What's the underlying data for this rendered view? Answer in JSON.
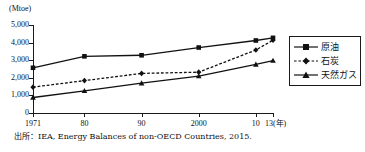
{
  "chart_data": {
    "type": "line",
    "title": "",
    "subtitle": "",
    "xlabel": "(年)",
    "ylabel": "(Mtoe)",
    "y_unit_caption": "(Mtoe)",
    "x_axis_suffix": "(年)",
    "categories": [
      "1971",
      "80",
      "90",
      "2000",
      "10",
      "13"
    ],
    "x": [
      1971,
      1980,
      1990,
      2000,
      2010,
      2013
    ],
    "xlim": [
      1971,
      2013
    ],
    "ylim": [
      0,
      5000
    ],
    "yticks": [
      0,
      1000,
      2000,
      3000,
      4000,
      5000
    ],
    "ytick_labels": [
      "0",
      "1,000",
      "2,000",
      "3,000",
      "4,000",
      "5,000"
    ],
    "xtick_labels": [
      "1971",
      "80",
      "90",
      "2000",
      "10",
      "13"
    ],
    "grid": false,
    "legend_position": "right",
    "series": [
      {
        "name": "原油",
        "values": [
          2570,
          3220,
          3280,
          3720,
          4120,
          4270
        ],
        "line_style": "solid",
        "marker": "square",
        "color": "#111111"
      },
      {
        "name": "石炭",
        "values": [
          1470,
          1840,
          2250,
          2320,
          3580,
          4140
        ],
        "line_style": "dashed",
        "marker": "diamond",
        "color": "#111111"
      },
      {
        "name": "天然ガス",
        "values": [
          880,
          1260,
          1700,
          2100,
          2760,
          2980
        ],
        "line_style": "solid",
        "marker": "triangle",
        "color": "#111111"
      }
    ]
  },
  "legend": {
    "items": [
      {
        "label": "原油"
      },
      {
        "label": "石炭"
      },
      {
        "label": "天然ガス"
      }
    ]
  },
  "source": {
    "text": "出所：IEA, Energy Balances of non-OECD Countries, 2015."
  },
  "colors": {
    "ink": "#111111",
    "axis": "#1a1a1a",
    "background": "#ffffff"
  }
}
